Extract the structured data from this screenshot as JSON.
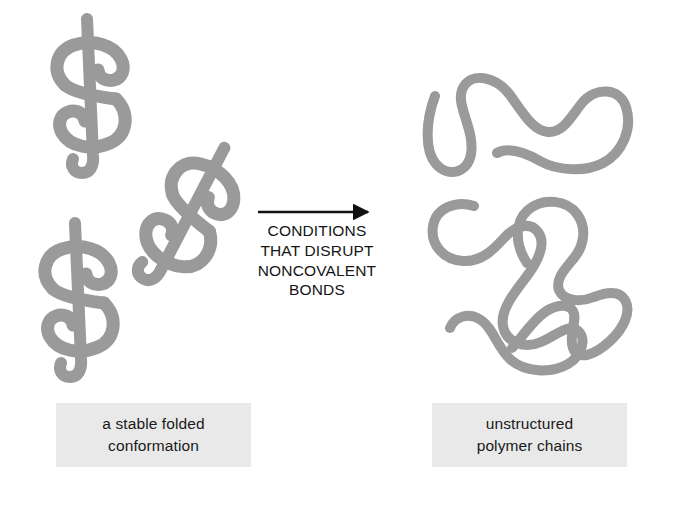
{
  "figure": {
    "kind": "protein-denaturation-diagram",
    "background_color": "#ffffff",
    "chain_color": "#9a9a9a",
    "arrow_color": "#111111",
    "caption_box_color": "#e9e9e9",
    "text_color": "#1a1a1a"
  },
  "left_panel": {
    "caption": {
      "line1": "a stable folded",
      "line2": "conformation"
    },
    "molecule_count": 3,
    "molecules": [
      {
        "name": "folded-protein-upper-left",
        "rotation_deg": 0
      },
      {
        "name": "folded-protein-middle",
        "rotation_deg": 30
      },
      {
        "name": "folded-protein-lower-left",
        "rotation_deg": 0
      }
    ]
  },
  "transition": {
    "arrow": "right-arrow",
    "label_lines": [
      "CONDITIONS",
      "THAT DISRUPT",
      "NONCOVALENT",
      "BONDS"
    ],
    "line1": "CONDITIONS",
    "line2": "THAT DISRUPT",
    "line3": "NONCOVALENT",
    "line4": "BONDS"
  },
  "right_panel": {
    "caption": {
      "line1": "unstructured",
      "line2": "polymer chains"
    },
    "chain_count": 3,
    "chains": [
      {
        "name": "unstructured-chain-top"
      },
      {
        "name": "unstructured-chain-lower-left"
      },
      {
        "name": "unstructured-chain-lower-right"
      }
    ]
  }
}
